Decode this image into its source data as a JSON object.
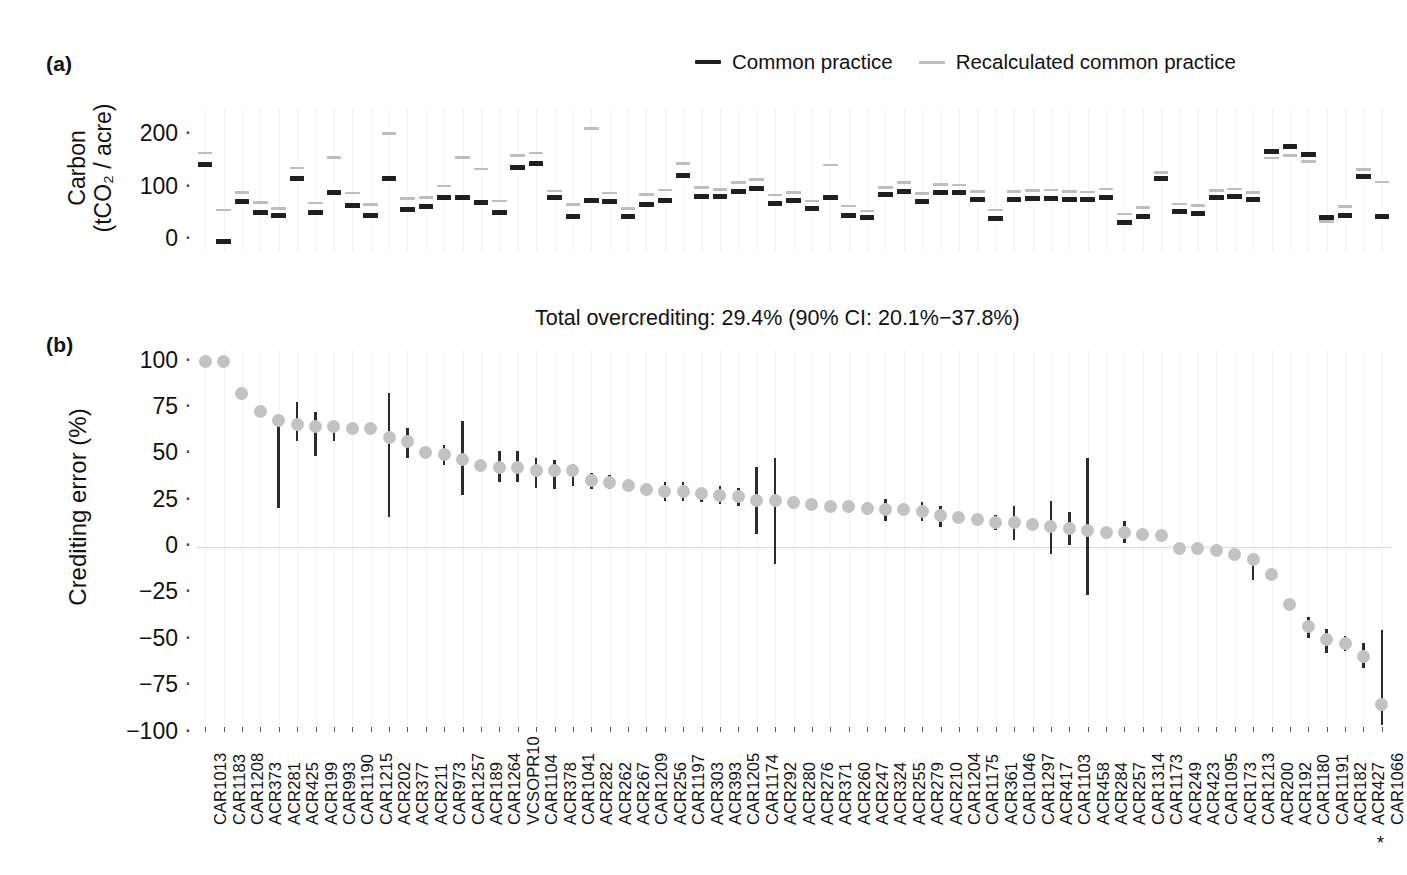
{
  "figure": {
    "panel_a_tag": "(a)",
    "panel_b_tag": "(b)",
    "note": "Total overcrediting: 29.4% (90% CI: 20.1%−37.8%)",
    "asterisk": "*"
  },
  "legend": {
    "items": [
      {
        "label": "Common practice",
        "color": "#1f1f1f",
        "key": "dark-dash-key"
      },
      {
        "label": "Recalculated common practice",
        "color": "#bdbdbd",
        "key": "light-dash-key"
      }
    ]
  },
  "colors": {
    "common_practice": "#1f1f1f",
    "recalculated": "#bdbdbd",
    "point": "#c2c2c2",
    "errorbar": "#2b2b2b",
    "gridline": "#f2f2f2",
    "zeroline": "#dcdcdc",
    "text": "#111111"
  },
  "chart_data": [
    {
      "type": "scatter",
      "panel": "(a)",
      "title": "",
      "ylabel": "Carbon (tCO₂ / acre)",
      "ylabel_line1": "Carbon",
      "ylabel_line2": "(tCO₂ / acre)",
      "xlabel": "",
      "yticks": [
        0,
        100,
        200
      ],
      "ytick_labels": [
        "0",
        "100",
        "200"
      ],
      "ylim": [
        -25,
        230
      ],
      "grid": "vertical-only",
      "categories": [
        "CAR1013",
        "CAR1183",
        "CAR1208",
        "ACR373",
        "ACR281",
        "ACR425",
        "ACR199",
        "CAR993",
        "CAR1190",
        "CAR1215",
        "ACR202",
        "ACR377",
        "ACR211",
        "CAR973",
        "CAR1257",
        "ACR189",
        "CAR1264",
        "VCSOPR10",
        "CAR1104",
        "ACR378",
        "CAR1041",
        "ACR282",
        "ACR262",
        "ACR267",
        "CAR1209",
        "ACR256",
        "CAR1197",
        "ACR303",
        "ACR393",
        "CAR1205",
        "CAR1174",
        "ACR292",
        "ACR280",
        "ACR276",
        "ACR371",
        "ACR260",
        "ACR247",
        "ACR324",
        "ACR255",
        "ACR279",
        "ACR210",
        "CAR1204",
        "CAR1175",
        "ACR361",
        "CAR1046",
        "CAR1297",
        "ACR417",
        "CAR1103",
        "ACR458",
        "ACR284",
        "ACR257",
        "CAR1314",
        "CAR1173",
        "ACR249",
        "ACR423",
        "CAR1095",
        "ACR173",
        "CAR1213",
        "ACR200",
        "ACR192",
        "CAR1180",
        "CAR1191",
        "ACR182",
        "ACR427",
        "CAR1066"
      ],
      "series": [
        {
          "name": "Common practice",
          "color": "#1f1f1f",
          "values": [
            149,
            1,
            78,
            57,
            51,
            121,
            57,
            95,
            71,
            51,
            121,
            63,
            69,
            86,
            85,
            76,
            58,
            142,
            150,
            86,
            50,
            80,
            79,
            50,
            73,
            80,
            128,
            88,
            87,
            97,
            102,
            74,
            80,
            64,
            85,
            52,
            47,
            92,
            97,
            79,
            96,
            95,
            82,
            46,
            81,
            83,
            84,
            82,
            81,
            85,
            38,
            50,
            121,
            59,
            55,
            85,
            88,
            81,
            174,
            182,
            168,
            47,
            52,
            126,
            50
          ]
        },
        {
          "name": "Recalculated common practice",
          "color": "#bdbdbd",
          "values": [
            168,
            60,
            93,
            74,
            63,
            140,
            73,
            160,
            92,
            70,
            205,
            81,
            83,
            105,
            160,
            138,
            77,
            163,
            168,
            96,
            70,
            215,
            92,
            63,
            89,
            98,
            148,
            103,
            99,
            112,
            118,
            88,
            93,
            77,
            145,
            67,
            58,
            103,
            112,
            91,
            108,
            107,
            95,
            60,
            95,
            97,
            98,
            95,
            94,
            100,
            52,
            64,
            131,
            71,
            68,
            97,
            100,
            93,
            159,
            163,
            152,
            38,
            66,
            137,
            113
          ]
        }
      ]
    },
    {
      "type": "scatter",
      "panel": "(b)",
      "title": "",
      "ylabel": "Crediting error (%)",
      "xlabel": "",
      "yticks": [
        -100,
        -75,
        -50,
        -25,
        0,
        25,
        50,
        75,
        100
      ],
      "ytick_labels": [
        "−100",
        "−75",
        "−50",
        "−25",
        "0",
        "25",
        "50",
        "75",
        "100"
      ],
      "ylim": [
        -105,
        105
      ],
      "grid": "vertical-only",
      "zero_reference_line": 0,
      "annotation": "Total overcrediting: 29.4% (90% CI: 20.1%−37.8%)",
      "categories": [
        "CAR1013",
        "CAR1183",
        "CAR1208",
        "ACR373",
        "ACR281",
        "ACR425",
        "ACR199",
        "CAR993",
        "CAR1190",
        "CAR1215",
        "ACR202",
        "ACR377",
        "ACR211",
        "CAR973",
        "CAR1257",
        "ACR189",
        "CAR1264",
        "VCSOPR10",
        "CAR1104",
        "ACR378",
        "CAR1041",
        "ACR282",
        "ACR262",
        "ACR267",
        "CAR1209",
        "ACR256",
        "CAR1197",
        "ACR303",
        "ACR393",
        "CAR1205",
        "CAR1174",
        "ACR292",
        "ACR280",
        "ACR276",
        "ACR371",
        "ACR260",
        "ACR247",
        "ACR324",
        "ACR255",
        "ACR279",
        "ACR210",
        "CAR1204",
        "CAR1175",
        "ACR361",
        "CAR1046",
        "CAR1297",
        "ACR417",
        "CAR1103",
        "ACR458",
        "ACR284",
        "ACR257",
        "CAR1314",
        "CAR1173",
        "ACR249",
        "ACR423",
        "CAR1095",
        "ACR173",
        "CAR1213",
        "ACR200",
        "ACR192",
        "CAR1180",
        "CAR1191",
        "ACR182",
        "ACR427",
        "CAR1066"
      ],
      "point_values": [
        100,
        100,
        83,
        73,
        68,
        66,
        65,
        65,
        64,
        64,
        59,
        57,
        51,
        50,
        47,
        44,
        43,
        43,
        41,
        41,
        41,
        36,
        35,
        33,
        31,
        30,
        30,
        29,
        28,
        27,
        25,
        25,
        24,
        23,
        22,
        22,
        21,
        20,
        20,
        19,
        17,
        16,
        15,
        13,
        13,
        12,
        11,
        10,
        9,
        8,
        8,
        7,
        6,
        -1,
        -1,
        -2,
        -4,
        -7,
        -15,
        -31,
        -43,
        -50,
        -52,
        -59,
        -85
      ],
      "ci_low": [
        100,
        100,
        83,
        73,
        21,
        57,
        49,
        57,
        64,
        64,
        16,
        48,
        51,
        44,
        28,
        44,
        35,
        35,
        32,
        31,
        33,
        31,
        31,
        30,
        31,
        25,
        25,
        24,
        23,
        22,
        7,
        -9,
        24,
        23,
        22,
        20,
        17,
        14,
        20,
        14,
        11,
        16,
        15,
        9,
        4,
        12,
        -4,
        1,
        -26,
        8,
        2,
        7,
        6,
        -1,
        -1,
        -2,
        -4,
        -18,
        -15,
        -31,
        -49,
        -57,
        -56,
        -65,
        -100
      ],
      "ci_high": [
        100,
        100,
        83,
        73,
        68,
        78,
        73,
        65,
        64,
        64,
        83,
        64,
        51,
        55,
        68,
        44,
        52,
        52,
        48,
        47,
        45,
        40,
        39,
        33,
        31,
        35,
        35,
        30,
        33,
        32,
        43,
        48,
        24,
        23,
        22,
        25,
        24,
        26,
        20,
        24,
        22,
        16,
        15,
        17,
        22,
        12,
        25,
        19,
        48,
        8,
        14,
        7,
        6,
        -1,
        -1,
        -2,
        -4,
        -5,
        -15,
        -31,
        -38,
        -44,
        -48,
        -52,
        -45
      ]
    }
  ]
}
